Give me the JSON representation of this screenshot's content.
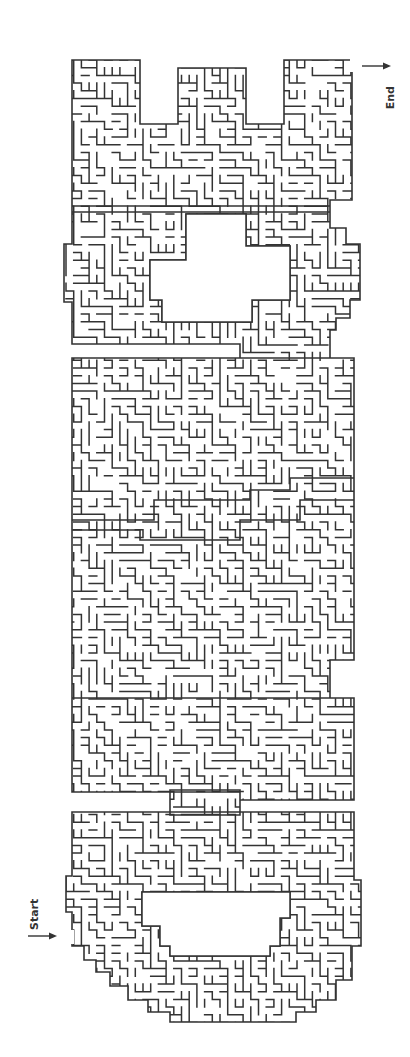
{
  "puzzle": {
    "type": "maze",
    "shape_word": "GAME",
    "orientation": "rotated 90 degrees, reads bottom-to-top",
    "wall_color": "#333333",
    "background_color": "#ffffff"
  },
  "labels": {
    "start": "Start",
    "end": "End"
  },
  "markers": {
    "start": {
      "arrow_direction": "right",
      "x": 28,
      "y": 936
    },
    "end": {
      "arrow_direction": "right",
      "x": 362,
      "y": 66
    }
  },
  "letters": [
    {
      "letter": "E",
      "region": "top"
    },
    {
      "letter": "M",
      "region": "upper-middle"
    },
    {
      "letter": "A",
      "region": "lower-middle"
    },
    {
      "letter": "G",
      "region": "bottom"
    }
  ],
  "maze": {
    "cell_size": 7.7,
    "seed": 20240611
  }
}
